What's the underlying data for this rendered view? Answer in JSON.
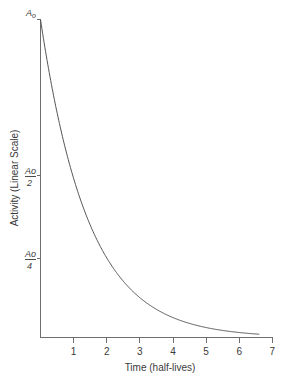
{
  "chart_data": {
    "type": "line",
    "title": "",
    "subtitle": "",
    "xlabel": "Time (half-lives)",
    "ylabel": "Activity (Linear Scale)",
    "xlim": [
      0,
      7
    ],
    "ylim": [
      0,
      1
    ],
    "grid": false,
    "legend": null,
    "x_ticks": [
      "1",
      "2",
      "3",
      "4",
      "5",
      "6",
      "7"
    ],
    "x_tick_values": [
      1,
      2,
      3,
      4,
      5,
      6,
      7
    ],
    "y_ticks": [
      "Ao",
      "Ao/2",
      "Ao/4"
    ],
    "y_tick_values": [
      1,
      0.5,
      0.25
    ],
    "series": [
      {
        "name": "Activity decay",
        "formula": "A = Ao * (1/2)^t",
        "x": [
          0,
          0.25,
          0.5,
          0.75,
          1,
          1.25,
          1.5,
          1.75,
          2,
          2.25,
          2.5,
          2.75,
          3,
          3.25,
          3.5,
          3.75,
          4,
          4.25,
          4.5,
          4.75,
          5,
          5.25,
          5.5,
          5.75,
          6,
          6.25,
          6.6
        ],
        "values": [
          1,
          0.841,
          0.707,
          0.595,
          0.5,
          0.42,
          0.354,
          0.297,
          0.25,
          0.21,
          0.177,
          0.149,
          0.125,
          0.105,
          0.088,
          0.074,
          0.0625,
          0.0526,
          0.0442,
          0.0372,
          0.03125,
          0.0263,
          0.0221,
          0.0186,
          0.0156,
          0.0131,
          0.0103
        ]
      }
    ]
  },
  "labels": {
    "y_axis_title": "Activity (Linear Scale)",
    "x_axis_title": "Time (half-lives)",
    "ao": "A",
    "ao_sub": "o",
    "ao_half_num": "Ao",
    "ao_half_den": "2",
    "ao_quarter_num": "Ao",
    "ao_quarter_den": "4",
    "x1": "1",
    "x2": "2",
    "x3": "3",
    "x4": "4",
    "x5": "5",
    "x6": "6",
    "x7": "7"
  },
  "colors": {
    "curve": "#555555",
    "axis": "#6e6e6e",
    "text": "#3a3a3a",
    "background": "#ffffff"
  }
}
